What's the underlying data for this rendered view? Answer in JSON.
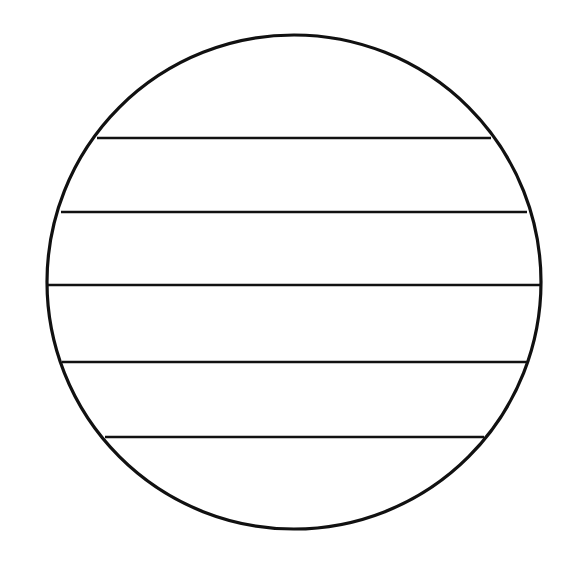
{
  "document": {
    "title": "Circle divided by horizontal chords",
    "background_color": "#ffffff",
    "width": 578,
    "height": 569
  },
  "chart_data": {
    "type": "diagram",
    "subtype": "circle-with-parallel-chords",
    "title": "",
    "subtitle": "",
    "xlabel": "",
    "ylabel": "",
    "grid": false,
    "legend": false,
    "annotations": [],
    "stroke_color": "#111111",
    "fill_color": "none",
    "circle": {
      "label": "outer-circle",
      "center_x": 294,
      "center_y": 282,
      "radius": 247,
      "stroke_width": 3.2,
      "fill": "none",
      "stroke": "#111111"
    },
    "chords": [
      {
        "index": 1,
        "label": "chord-1",
        "y": 138,
        "x_start": 97,
        "x_end": 491,
        "length": 394,
        "stroke_width": 2.6,
        "stroke": "#111111"
      },
      {
        "index": 2,
        "label": "chord-2",
        "y": 212,
        "x_start": 61,
        "x_end": 527,
        "length": 466,
        "stroke_width": 2.6,
        "stroke": "#111111"
      },
      {
        "index": 3,
        "label": "chord-3",
        "y": 285,
        "x_start": 47,
        "x_end": 541,
        "length": 494,
        "stroke_width": 2.6,
        "stroke": "#111111"
      },
      {
        "index": 4,
        "label": "chord-4",
        "y": 362,
        "x_start": 62,
        "x_end": 527,
        "length": 465,
        "stroke_width": 2.6,
        "stroke": "#111111"
      },
      {
        "index": 5,
        "label": "chord-5",
        "y": 437,
        "x_start": 105,
        "x_end": 484,
        "length": 379,
        "stroke_width": 2.6,
        "stroke": "#111111"
      }
    ],
    "bands": [
      {
        "index": 1,
        "label": "band-top-cap",
        "top": 35,
        "bottom": 138
      },
      {
        "index": 2,
        "label": "band-2",
        "top": 138,
        "bottom": 212
      },
      {
        "index": 3,
        "label": "band-3",
        "top": 212,
        "bottom": 285
      },
      {
        "index": 4,
        "label": "band-4",
        "top": 285,
        "bottom": 362
      },
      {
        "index": 5,
        "label": "band-5",
        "top": 362,
        "bottom": 437
      },
      {
        "index": 6,
        "label": "band-bottom-cap",
        "top": 437,
        "bottom": 529
      }
    ],
    "counts": {
      "chord_count": 5,
      "region_count": 6
    }
  }
}
